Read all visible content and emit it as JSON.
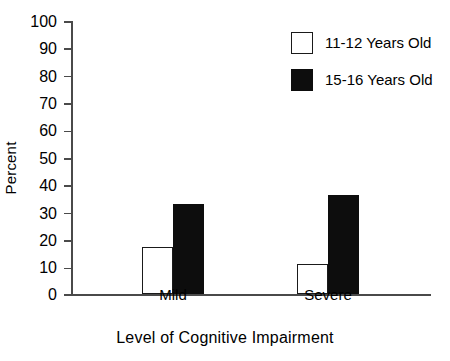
{
  "chart_data": {
    "type": "bar",
    "title": "",
    "xlabel": "Level of Cognitive Impairment",
    "ylabel": "Percent",
    "categories": [
      "Mild",
      "Severe"
    ],
    "series": [
      {
        "name": "11-12 Years Old",
        "values": [
          17,
          11
        ],
        "fill": "#ffffff",
        "edge": "#1a1a1a"
      },
      {
        "name": "15-16 Years Old",
        "values": [
          33,
          36
        ],
        "fill": "#0d0d0d",
        "edge": "#0d0d0d"
      }
    ],
    "ylim": [
      0,
      100
    ],
    "ytick_step": 10,
    "yticks": [
      100,
      90,
      80,
      70,
      60,
      50,
      40,
      30,
      20,
      10,
      0
    ],
    "ytick_labels": [
      "100",
      "90",
      "80",
      "70",
      "60",
      "50",
      "40",
      "30",
      "20",
      "10",
      "0"
    ],
    "grid": false,
    "legend_position": "top-right"
  },
  "axis": {
    "y_title": "Percent",
    "x_title": "Level of Cognitive Impairment",
    "tick_0": "0",
    "tick_10": "10",
    "tick_20": "20",
    "tick_30": "30",
    "tick_40": "40",
    "tick_50": "50",
    "tick_60": "60",
    "tick_70": "70",
    "tick_80": "80",
    "tick_90": "90",
    "tick_100": "100"
  },
  "categories": {
    "mild": "Mild",
    "severe": "Severe"
  },
  "legend": {
    "items": [
      {
        "label": "11-12 Years Old",
        "style": "open"
      },
      {
        "label": "15-16 Years Old",
        "style": "filled"
      }
    ]
  },
  "colors": {
    "axis": "#4a4a4a",
    "bar_open_fill": "#ffffff",
    "bar_open_edge": "#1a1a1a",
    "bar_filled": "#0d0d0d",
    "background": "#ffffff",
    "text": "#000000"
  }
}
